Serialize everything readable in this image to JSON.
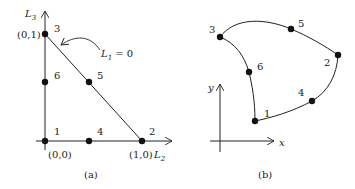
{
  "figure_a": {
    "caption": "(a)",
    "axis_x_label": "L",
    "axis_x_sub": "2",
    "axis_y_label": "L",
    "axis_y_sub": "3",
    "annotation_label": "L",
    "annotation_sub": "1",
    "annotation_rest": " = 0",
    "nodes": [
      {
        "id": "1",
        "coord": "(0,0)"
      },
      {
        "id": "2",
        "coord": "(1,0)"
      },
      {
        "id": "3",
        "coord": "(0,1)"
      },
      {
        "id": "4",
        "coord": ""
      },
      {
        "id": "5",
        "coord": ""
      },
      {
        "id": "6",
        "coord": ""
      }
    ]
  },
  "figure_b": {
    "caption": "(b)",
    "axis_x_label": "x",
    "axis_y_label": "y",
    "side_label": "L",
    "side_sub": "2",
    "nodes": [
      {
        "id": "1"
      },
      {
        "id": "2"
      },
      {
        "id": "3"
      },
      {
        "id": "4"
      },
      {
        "id": "5"
      },
      {
        "id": "6"
      }
    ]
  }
}
